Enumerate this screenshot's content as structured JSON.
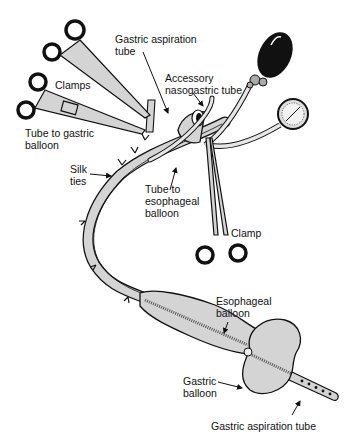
{
  "diagram": {
    "labels": {
      "gastric_aspiration_tube_top": "Gastric aspiration\ntube",
      "accessory_nasogastric_tube": "Accessory\nnasogastric tube",
      "clamps": "Clamps",
      "tube_to_gastric_balloon": "Tube to gastric\nballoon",
      "silk_ties": "Silk\nties",
      "tube_to_esophageal_balloon": "Tube to\nesophageal\nballoon",
      "clamp": "Clamp",
      "esophageal_balloon": "Esophageal\nballoon",
      "gastric_balloon": "Gastric\nballoon",
      "gastric_aspiration_tube_bottom": "Gastric aspiration tube"
    },
    "components": [
      "clamps",
      "inflation-bulb",
      "pressure-gauge",
      "esophageal-balloon",
      "gastric-balloon",
      "silk-ties",
      "accessory-nasogastric-tube"
    ],
    "colors": {
      "line": "#111111",
      "fill": "#d4d4d4",
      "bulb": "#111111",
      "background": "#ffffff"
    }
  }
}
